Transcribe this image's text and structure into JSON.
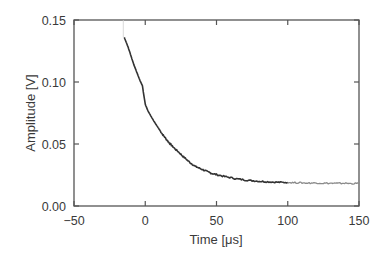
{
  "chart_data": {
    "type": "line",
    "title": "",
    "xlabel": "Time [μs]",
    "ylabel": "Amplitude [V]",
    "xlim": [
      -50,
      150
    ],
    "ylim": [
      0.0,
      0.15
    ],
    "xticks": [
      -50,
      0,
      50,
      100,
      150
    ],
    "xtick_labels": [
      "−50",
      "0",
      "50",
      "100",
      "150"
    ],
    "yticks": [
      0.0,
      0.05,
      0.1,
      0.15
    ],
    "ytick_labels": [
      "0.00",
      "0.05",
      "0.10",
      "0.15"
    ],
    "grid": false,
    "legend": null,
    "series": [
      {
        "name": "decay signal",
        "color": "#333333",
        "x": [
          -14.7,
          -12,
          -10,
          -8,
          -6,
          -4,
          -2,
          0,
          2,
          4,
          6,
          8,
          10,
          12,
          14,
          16,
          18,
          20,
          23,
          26,
          29,
          32,
          35,
          38,
          41,
          44,
          47,
          50,
          55,
          60,
          65,
          70,
          75,
          80,
          85,
          90,
          95,
          100
        ],
        "y": [
          0.136,
          0.128,
          0.121,
          0.114,
          0.108,
          0.102,
          0.097,
          0.082,
          0.0765,
          0.0725,
          0.0685,
          0.065,
          0.0615,
          0.058,
          0.055,
          0.052,
          0.0495,
          0.047,
          0.044,
          0.0405,
          0.0375,
          0.0345,
          0.032,
          0.0305,
          0.029,
          0.0275,
          0.0262,
          0.0253,
          0.024,
          0.0228,
          0.0218,
          0.021,
          0.0204,
          0.02,
          0.0196,
          0.0193,
          0.0191,
          0.019
        ]
      },
      {
        "name": "decay signal (tail)",
        "color": "#8a8a8a",
        "x": [
          100,
          105,
          110,
          115,
          120,
          125,
          130,
          135,
          140,
          145,
          150
        ],
        "y": [
          0.019,
          0.0188,
          0.0187,
          0.0185,
          0.0186,
          0.0184,
          0.0183,
          0.0182,
          0.0184,
          0.0181,
          0.0182
        ]
      }
    ],
    "annotations": []
  },
  "axes": {
    "x_label": "Time [μs]",
    "y_label": "Amplitude [V]"
  }
}
